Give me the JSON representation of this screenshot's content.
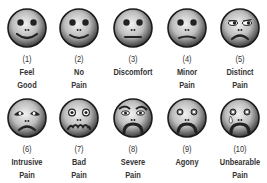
{
  "colors": {
    "face_light": "#e6e6e6",
    "face_dark": "#4a4a4a",
    "outline": "#1a1a1a",
    "text": "#333333",
    "tear": "#bfbfbf"
  },
  "rows": [
    [
      {
        "number": "(1)",
        "line1": "Feel",
        "line2": "Good",
        "expression": "smile"
      },
      {
        "number": "(2)",
        "line1": "No",
        "line2": "Pain",
        "expression": "smile"
      },
      {
        "number": "(3)",
        "line1": "Discomfort",
        "line2": "",
        "expression": "neutral"
      },
      {
        "number": "(4)",
        "line1": "Minor",
        "line2": "Pain",
        "expression": "slight-frown"
      },
      {
        "number": "(5)",
        "line1": "Distinct",
        "line2": "Pain",
        "expression": "frown-sideeye"
      }
    ],
    [
      {
        "number": "(6)",
        "line1": "Intrusive",
        "line2": "Pain",
        "expression": "sad-worried"
      },
      {
        "number": "(7)",
        "line1": "Bad",
        "line2": "Pain",
        "expression": "wavy-mouth"
      },
      {
        "number": "(8)",
        "line1": "Severe",
        "line2": "Pain",
        "expression": "angry-frown"
      },
      {
        "number": "(9)",
        "line1": "Agony",
        "line2": "",
        "expression": "deep-frown"
      },
      {
        "number": "(10)",
        "line1": "Unbearable",
        "line2": "Pain",
        "expression": "crying"
      }
    ]
  ]
}
